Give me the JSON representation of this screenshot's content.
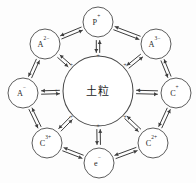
{
  "diagram": {
    "center": {
      "label": "土粒",
      "name": "soil-particle",
      "radius": 35,
      "cx": 98,
      "cy": 91,
      "surface_charge_symbol": "+",
      "surface_charge_count": 8,
      "stroke_color": "#4a4a4a",
      "fill_color": "#ffffff"
    },
    "arrow_style": "double-headed-equilibrium",
    "arrow_color": "#3d3d3d",
    "nodes": [
      {
        "name": "node-p-plus",
        "base": "P",
        "sup": "+",
        "angle": -90,
        "cx": 98,
        "cy": 22,
        "r": 15
      },
      {
        "name": "node-a-3-minus",
        "base": "A",
        "sup": "3−",
        "angle": -45,
        "cx": 156,
        "cy": 44,
        "r": 15
      },
      {
        "name": "node-c-plus",
        "base": "C",
        "sup": "+",
        "angle": 0,
        "cx": 176,
        "cy": 93,
        "r": 15
      },
      {
        "name": "node-c-2-plus",
        "base": "C",
        "sup": "2+",
        "angle": 45,
        "cx": 153,
        "cy": 143,
        "r": 15
      },
      {
        "name": "node-e-minus",
        "base": "e",
        "sup": "−",
        "angle": 90,
        "cx": 99,
        "cy": 163,
        "r": 15
      },
      {
        "name": "node-c-3-plus",
        "base": "C",
        "sup": "3+",
        "angle": 135,
        "cx": 47,
        "cy": 143,
        "r": 15
      },
      {
        "name": "node-a-minus",
        "base": "A",
        "sup": "−",
        "angle": 180,
        "cx": 23,
        "cy": 93,
        "r": 15
      },
      {
        "name": "node-a-2-minus",
        "base": "A",
        "sup": "2−",
        "angle": -135,
        "cx": 45,
        "cy": 44,
        "r": 15
      }
    ],
    "charges": [
      {
        "name": "charge-left",
        "symbol": "+",
        "x": 56,
        "y": 92
      },
      {
        "name": "charge-upper-left",
        "symbol": "+",
        "x": 71,
        "y": 66
      },
      {
        "name": "charge-top",
        "symbol": "+",
        "x": 98,
        "y": 57
      },
      {
        "name": "charge-upper-right",
        "symbol": "+",
        "x": 125,
        "y": 66
      },
      {
        "name": "charge-right",
        "symbol": "+",
        "x": 140,
        "y": 92
      },
      {
        "name": "charge-lower-right",
        "symbol": "+",
        "x": 125,
        "y": 118
      },
      {
        "name": "charge-bottom",
        "symbol": "+",
        "x": 98,
        "y": 127
      },
      {
        "name": "charge-lower-left",
        "symbol": "+",
        "x": 71,
        "y": 118
      }
    ]
  }
}
